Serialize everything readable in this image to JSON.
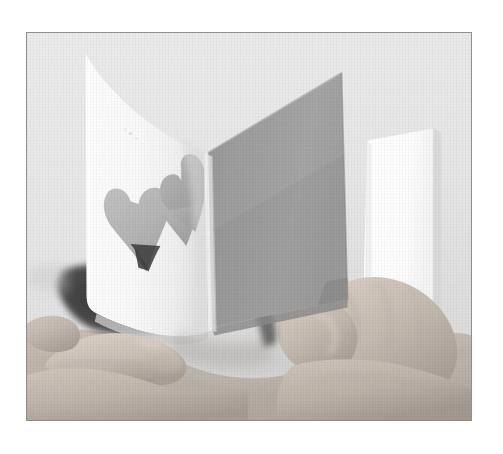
{
  "page": {
    "kind": "photograph",
    "width": 503,
    "height": 454,
    "page_background": "#ffffff",
    "caption": "Two hands hold a white folded card; two heart shapes are cut out of the front panel, the back panel is shaded grey and a white sheet stands behind it."
  },
  "frame": {
    "name": "photo-frame",
    "border_color": "#8e8e8e",
    "border_width_px": 1,
    "left": 26,
    "top": 32,
    "width": 446,
    "height": 389
  },
  "photo": {
    "background_color": "#e9e9e9",
    "alt_text": "Hands bending open a white card with two heart cut-outs",
    "subject_count": 2,
    "objects": [
      {
        "id": "left-panel",
        "label": "card front panel with heart cut-outs",
        "color": "#fbfbfb",
        "shadow_color": "#d7d7d7"
      },
      {
        "id": "right-panel",
        "label": "card back panel in shadow",
        "color": "#9b9b9b",
        "highlight_color": "#a8a8a8"
      },
      {
        "id": "fold-crease",
        "label": "vertical fold crease of the card",
        "color": "#cfcfcf"
      },
      {
        "id": "rear-sheet",
        "label": "white sheet of paper standing behind the card",
        "color": "#ffffff"
      },
      {
        "id": "heart-cutout-front",
        "label": "left heart cut-out",
        "fill_color": "#b8b8b8"
      },
      {
        "id": "heart-cutout-fold",
        "label": "right heart cut-out across the fold",
        "fill_color": "#a9a9a9"
      },
      {
        "id": "interior-shadow",
        "label": "dark shadowed interior of the card",
        "color": "#3a3a3a"
      },
      {
        "id": "left-hand",
        "label": "left hand holding the card edge",
        "skin_color": "#c9beb4"
      },
      {
        "id": "right-hand",
        "label": "right hand gripping the card at the fold",
        "skin_color": "#cdc2b8"
      },
      {
        "id": "forearms",
        "label": "forearms crossing the lower part of the frame",
        "skin_color": "#c3b8ae"
      }
    ],
    "palette": {
      "background": "#e9e9e9",
      "paper_white": "#fbfbfb",
      "paper_bright_white": "#ffffff",
      "panel_grey": "#9b9b9b",
      "heart_grey": "#b4b4b4",
      "skin_light": "#d5cbc1",
      "skin_mid": "#bdb2a8",
      "skin_dark": "#8d8279",
      "deep_shadow": "#333333",
      "frame_border": "#8e8e8e"
    }
  }
}
